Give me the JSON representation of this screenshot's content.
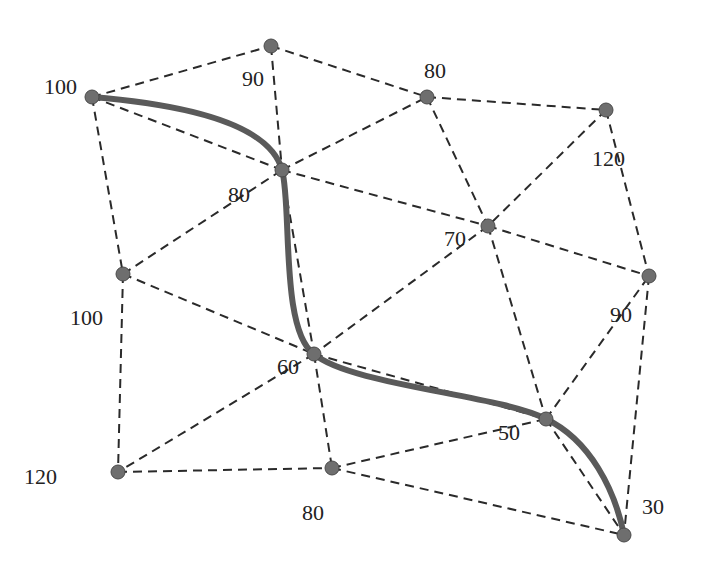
{
  "graph": {
    "nodes": [
      {
        "id": "A",
        "x": 92,
        "y": 97,
        "label": "100",
        "lx": 44,
        "ly": 94
      },
      {
        "id": "B",
        "x": 271,
        "y": 46,
        "label": "90",
        "lx": 242,
        "ly": 86
      },
      {
        "id": "C",
        "x": 427,
        "y": 97,
        "label": "80",
        "lx": 424,
        "ly": 78
      },
      {
        "id": "D",
        "x": 606,
        "y": 110,
        "label": "120",
        "lx": 592,
        "ly": 166
      },
      {
        "id": "E",
        "x": 282,
        "y": 170,
        "label": "80",
        "lx": 228,
        "ly": 202
      },
      {
        "id": "F",
        "x": 488,
        "y": 226,
        "label": "70",
        "lx": 444,
        "ly": 246
      },
      {
        "id": "G",
        "x": 123,
        "y": 274,
        "label": "100",
        "lx": 70,
        "ly": 325
      },
      {
        "id": "H",
        "x": 649,
        "y": 276,
        "label": "90",
        "lx": 610,
        "ly": 322
      },
      {
        "id": "I",
        "x": 314,
        "y": 354,
        "label": "60",
        "lx": 277,
        "ly": 374
      },
      {
        "id": "J",
        "x": 546,
        "y": 419,
        "label": "50",
        "lx": 498,
        "ly": 440
      },
      {
        "id": "K",
        "x": 118,
        "y": 472,
        "label": "120",
        "lx": 24,
        "ly": 484
      },
      {
        "id": "L",
        "x": 332,
        "y": 468,
        "label": "80",
        "lx": 302,
        "ly": 520
      },
      {
        "id": "M",
        "x": 624,
        "y": 535,
        "label": "30",
        "lx": 642,
        "ly": 514
      }
    ],
    "edges": [
      [
        "A",
        "B"
      ],
      [
        "A",
        "E"
      ],
      [
        "A",
        "G"
      ],
      [
        "B",
        "E"
      ],
      [
        "B",
        "C"
      ],
      [
        "E",
        "C"
      ],
      [
        "E",
        "I"
      ],
      [
        "E",
        "F"
      ],
      [
        "G",
        "E"
      ],
      [
        "G",
        "I"
      ],
      [
        "G",
        "K"
      ],
      [
        "C",
        "F"
      ],
      [
        "C",
        "D"
      ],
      [
        "D",
        "F"
      ],
      [
        "D",
        "H"
      ],
      [
        "F",
        "H"
      ],
      [
        "F",
        "I"
      ],
      [
        "F",
        "J"
      ],
      [
        "I",
        "J"
      ],
      [
        "I",
        "K"
      ],
      [
        "I",
        "L"
      ],
      [
        "K",
        "L"
      ],
      [
        "L",
        "J"
      ],
      [
        "L",
        "M"
      ],
      [
        "J",
        "H"
      ],
      [
        "J",
        "M"
      ],
      [
        "H",
        "M"
      ]
    ],
    "highlighted_path": [
      "A",
      "E",
      "I",
      "J",
      "M"
    ],
    "colors": {
      "node_fill": "#6e6e6e",
      "edge": "#2a2a2a",
      "path": "#5a5a5a",
      "label": "#222222"
    }
  }
}
